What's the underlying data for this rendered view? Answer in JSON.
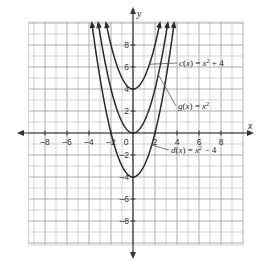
{
  "chart_data": {
    "type": "line",
    "title": "",
    "xlabel": "x",
    "ylabel": "y",
    "xlim": [
      -9.5,
      10
    ],
    "ylim": [
      -10,
      10
    ],
    "grid": true,
    "x_tick_labels": [
      "-8",
      "-6",
      "-4",
      "-2",
      "0",
      "2",
      "4",
      "6",
      "8"
    ],
    "y_tick_labels": [
      "8",
      "6",
      "4",
      "2",
      "-2",
      "-4",
      "-6",
      "-8"
    ],
    "series": [
      {
        "name": "c(x) = x² + 4",
        "formula": "x^2 + 4",
        "vertex": [
          0,
          4
        ],
        "shift": 4
      },
      {
        "name": "g(x) = x²",
        "formula": "x^2",
        "vertex": [
          0,
          0
        ],
        "shift": 0
      },
      {
        "name": "d(x) = x² − 4",
        "formula": "x^2 - 4",
        "vertex": [
          0,
          -4
        ],
        "shift": -4
      }
    ],
    "annotations": [
      {
        "text_parts": [
          "c",
          "(",
          "x",
          ") = ",
          "x",
          "2",
          " + 4"
        ],
        "label": "c(x) = x² + 4",
        "points_to": [
          1.5,
          6.25
        ]
      },
      {
        "text_parts": [
          "g",
          "(",
          "x",
          ") = ",
          "x",
          "2",
          ""
        ],
        "label": "g(x) = x²",
        "points_to": [
          2.3,
          5.3
        ]
      },
      {
        "text_parts": [
          "d",
          "(",
          "x",
          ") = ",
          "x",
          "2",
          " − 4"
        ],
        "label": "d(x) = x² − 4",
        "points_to": [
          1.7,
          -1.1
        ]
      }
    ],
    "legend_position": "inline annotations"
  },
  "colors": {
    "grid_minor": "#c8c8c8",
    "grid_major": "#9a9a9a",
    "axis": "#333333",
    "curve": "#2a2a2a"
  }
}
